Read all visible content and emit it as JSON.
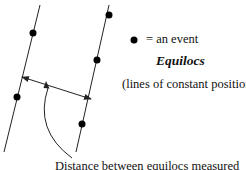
{
  "legend": {
    "event_label": "= an event",
    "title": "Equilocs",
    "subtitle": "(lines of constant position)"
  },
  "caption": "Distance between equilocs measured",
  "diagram": {
    "line_color": "#222222",
    "dot_color": "#000000",
    "lines": [
      {
        "name": "equiloc-left",
        "x1": 40,
        "y1": 5,
        "x2": 4,
        "y2": 152
      },
      {
        "name": "equiloc-right",
        "x1": 109,
        "y1": 5,
        "x2": 76,
        "y2": 152
      }
    ],
    "events": [
      {
        "x": 33,
        "y": 33
      },
      {
        "x": 17,
        "y": 97
      },
      {
        "x": 109,
        "y": 15
      },
      {
        "x": 97,
        "y": 60
      },
      {
        "x": 82,
        "y": 124
      }
    ],
    "distance_arrow": {
      "x1": 22,
      "y1": 77,
      "x2": 91,
      "y2": 99
    },
    "pointer_curve": "M 46 85 Q 34 130 72 158"
  }
}
